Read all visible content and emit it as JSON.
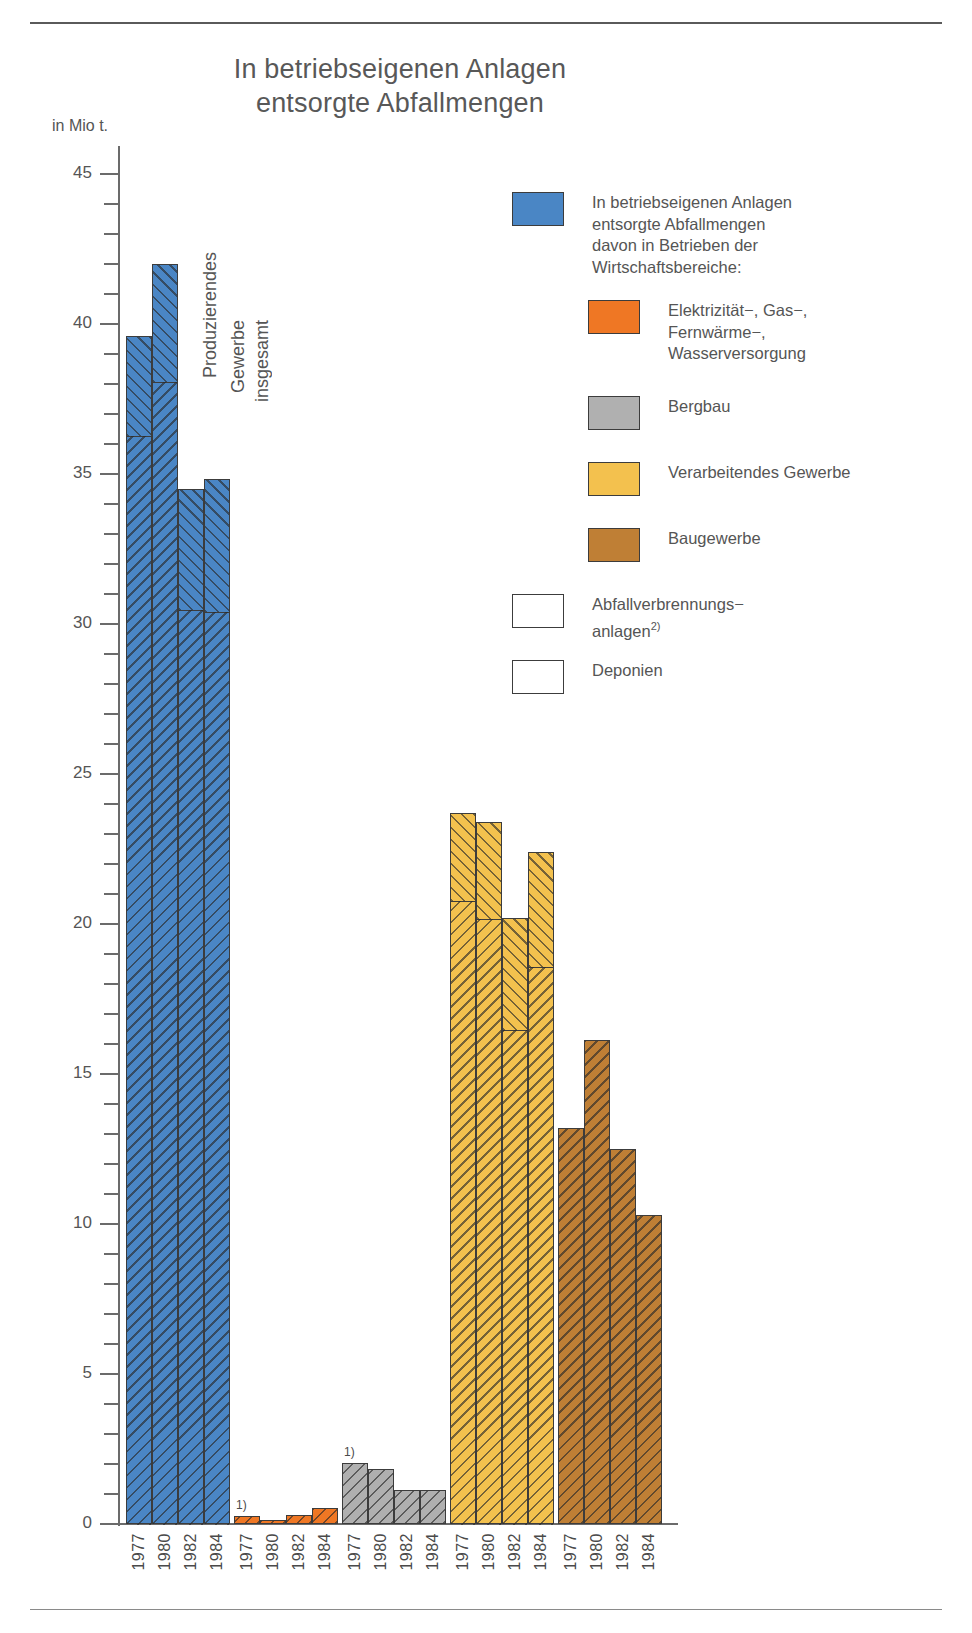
{
  "title": "In betriebseigenen Anlagen\nentsorgte Abfallmengen",
  "title_line1": "In betriebseigenen Anlagen",
  "title_line2": "entsorgte Abfallmengen",
  "axis_unit": "in Mio t.",
  "group_annotation": {
    "line1": "Produzierendes",
    "line2": "Gewerbe",
    "line3": "insgesamt"
  },
  "footnote_marks": {
    "mark1": "1)",
    "mark2": "2)"
  },
  "legend": {
    "items": [
      {
        "name": "total",
        "color": "#4a86c5",
        "pattern": "solid",
        "label": "In betriebseigenen Anlagen\nentsorgte Abfallmengen\ndavon in Betrieben der\nWirtschaftsbereiche:",
        "lines": [
          "In betriebseigenen Anlagen",
          "entsorgte Abfallmengen",
          "davon in Betrieben der",
          "Wirtschaftsbereiche:"
        ]
      },
      {
        "name": "energy",
        "color": "#ef7724",
        "pattern": "solid",
        "label": "Elektrizität−, Gas−,\nFernwärme−,\nWasserversorgung",
        "lines": [
          "Elektrizität−, Gas−,",
          "Fernwärme−,",
          "Wasserversorgung"
        ]
      },
      {
        "name": "mining",
        "color": "#b0b0b0",
        "pattern": "solid",
        "label": "Bergbau",
        "lines": [
          "Bergbau"
        ]
      },
      {
        "name": "manufacturing",
        "color": "#f3c14e",
        "pattern": "solid",
        "label": "Verarbeitendes Gewerbe",
        "lines": [
          "Verarbeitendes Gewerbe"
        ]
      },
      {
        "name": "construction",
        "color": "#bf7f35",
        "pattern": "solid",
        "label": "Baugewerbe",
        "lines": [
          "Baugewerbe"
        ]
      },
      {
        "name": "incineration",
        "color": "#ffffff",
        "pattern": "hatch-forward",
        "label": "Abfallverbrennungs−\nanlagen2)",
        "lines": [
          "Abfallverbrennungs−",
          "anlagen"
        ],
        "sup": "2)"
      },
      {
        "name": "landfill",
        "color": "#ffffff",
        "pattern": "hatch-backward",
        "label": "Deponien",
        "lines": [
          "Deponien"
        ]
      }
    ]
  },
  "chart_data": {
    "type": "bar",
    "title": "In betriebseigenen Anlagen entsorgte Abfallmengen",
    "xlabel": "",
    "ylabel": "in Mio t.",
    "ylim": [
      0,
      45
    ],
    "yticks": [
      0,
      5,
      10,
      15,
      20,
      25,
      30,
      35,
      40,
      45
    ],
    "ytick_labels": [
      "0",
      "5",
      "10",
      "15",
      "20",
      "25",
      "30",
      "35",
      "40",
      "45"
    ],
    "minor_tick_step": 1,
    "grid": false,
    "legend_position": "right",
    "categories": [
      "1977",
      "1980",
      "1982",
      "1984"
    ],
    "stack_components": [
      "Abfallverbrennungsanlagen",
      "Deponien"
    ],
    "groups": [
      {
        "name": "Produzierendes Gewerbe insgesamt",
        "color": "#4a86c5",
        "totals": [
          39.6,
          42.0,
          34.5,
          34.85
        ],
        "incineration": [
          3.3,
          3.9,
          4.0,
          4.4
        ],
        "landfill": [
          36.3,
          38.1,
          30.5,
          30.45
        ]
      },
      {
        "name": "Elektrizität−, Gas−, Fernwärme−, Wasserversorgung",
        "color": "#ef7724",
        "totals": [
          0.28,
          0.15,
          0.3,
          0.55
        ],
        "incineration": [
          0.0,
          0.0,
          0.0,
          0.0
        ],
        "landfill": [
          0.28,
          0.15,
          0.3,
          0.55
        ],
        "footnote": "1)"
      },
      {
        "name": "Bergbau",
        "color": "#b0b0b0",
        "totals": [
          2.05,
          1.85,
          1.15,
          1.15
        ],
        "incineration": [
          0.0,
          0.0,
          0.0,
          0.0
        ],
        "landfill": [
          2.05,
          1.85,
          1.15,
          1.15
        ],
        "footnote": "1)"
      },
      {
        "name": "Verarbeitendes Gewerbe",
        "color": "#f3c14e",
        "totals": [
          23.7,
          23.4,
          20.2,
          22.4
        ],
        "incineration": [
          2.9,
          3.2,
          3.7,
          3.8
        ],
        "landfill": [
          20.8,
          20.2,
          16.5,
          18.6
        ]
      },
      {
        "name": "Baugewerbe",
        "color": "#bf7f35",
        "totals": [
          13.2,
          16.15,
          12.5,
          10.3
        ],
        "incineration": [
          0.0,
          0.0,
          0.0,
          0.0
        ],
        "landfill": [
          13.2,
          16.15,
          12.5,
          10.3
        ]
      }
    ]
  }
}
